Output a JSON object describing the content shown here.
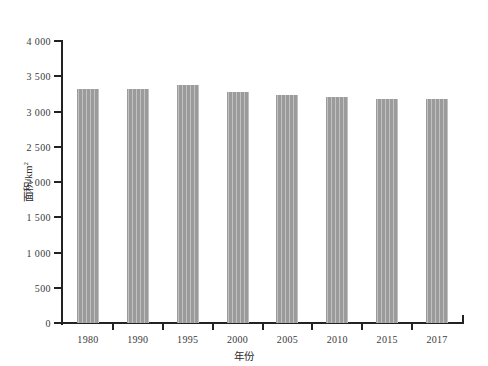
{
  "chart_data": {
    "type": "bar",
    "title": "",
    "subtitle": "",
    "xlabel": "年份",
    "ylabel": "面积/km2",
    "ylabel_base": "面积/km",
    "ylabel_exponent": "2",
    "categories": [
      "1980",
      "1990",
      "1995",
      "2000",
      "2005",
      "2010",
      "2015",
      "2017"
    ],
    "values": [
      3320,
      3320,
      3375,
      3270,
      3230,
      3200,
      3180,
      3175
    ],
    "series": [
      {
        "name": "面积",
        "values": [
          3320,
          3320,
          3375,
          3270,
          3230,
          3200,
          3180,
          3175
        ]
      }
    ],
    "ylim": [
      0,
      4000
    ],
    "ytick_values": [
      0,
      500,
      1000,
      1500,
      2000,
      2500,
      3000,
      3500,
      4000
    ],
    "ytick_labels": [
      "0",
      "500",
      "1 000",
      "1 500",
      "2 000",
      "2 500",
      "3 000",
      "3 500",
      "4 000"
    ],
    "grid": false,
    "legend": false,
    "legend_position": "none",
    "bar_color": "#9b9b9b",
    "axis_color": "#222222",
    "background_color": "#ffffff"
  }
}
